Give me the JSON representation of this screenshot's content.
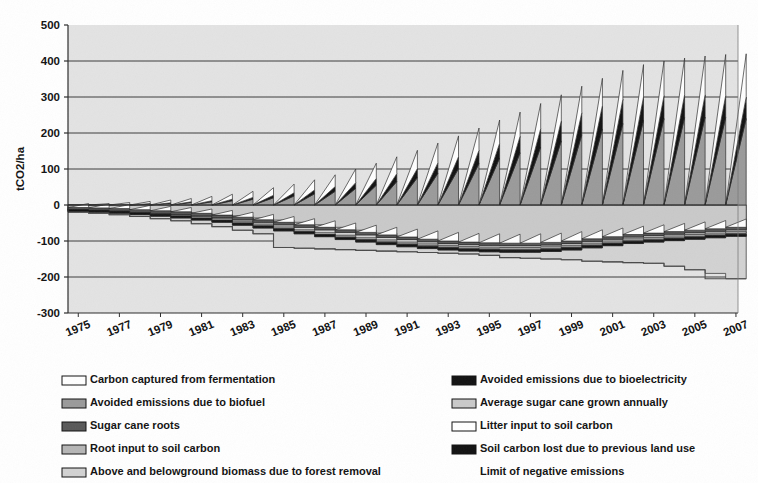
{
  "chart_data": {
    "type": "area",
    "title": "",
    "subtitle": "",
    "xlabel": "",
    "ylabel": "tCO2/ha",
    "ylim": [
      -300,
      500
    ],
    "xlim": [
      1975,
      2008
    ],
    "ytick_step": 100,
    "yticks": [
      "500",
      "400",
      "300",
      "200",
      "100",
      "0",
      "-100",
      "-200",
      "-300"
    ],
    "xticks": [
      "1975",
      "1977",
      "1979",
      "1981",
      "1983",
      "1985",
      "1987",
      "1989",
      "1991",
      "1993",
      "1995",
      "1997",
      "1999",
      "2001",
      "2003",
      "2005",
      "2007"
    ],
    "x_all_years": [
      1975,
      1976,
      1977,
      1978,
      1979,
      1980,
      1981,
      1982,
      1983,
      1984,
      1985,
      1986,
      1987,
      1988,
      1989,
      1990,
      1991,
      1992,
      1993,
      1994,
      1995,
      1996,
      1997,
      1998,
      1999,
      2000,
      2001,
      2002,
      2003,
      2004,
      2005,
      2006,
      2007
    ],
    "grid": "horizontal",
    "plot_background": "#e3e3e3",
    "legend_position": "below-two-columns",
    "series": [
      {
        "name": "Carbon captured from fermentation",
        "color": "#ffffff",
        "sawtooth": true,
        "cumulative_top_at_peak": [
          -12,
          -14,
          -16,
          -18,
          -21,
          -24,
          -28,
          -32,
          -37,
          -44,
          -50,
          -58,
          -66,
          -76,
          -86,
          -97,
          -108,
          -120,
          -132,
          -145,
          -158,
          -172,
          -186,
          -200,
          -214,
          -228,
          -242,
          -255,
          -268,
          -280,
          -292,
          -303,
          -314
        ],
        "peak_values": [
          2,
          4,
          7,
          10,
          14,
          18,
          24,
          30,
          38,
          48,
          58,
          70,
          84,
          100,
          116,
          134,
          152,
          172,
          192,
          214,
          236,
          258,
          282,
          306,
          330,
          352,
          374,
          390,
          400,
          408,
          414,
          418,
          420
        ]
      },
      {
        "name": "Avoided emissions due to bioelectricity",
        "color": "#111111",
        "sawtooth": true,
        "peak_values": [
          0,
          1,
          2,
          4,
          6,
          9,
          12,
          16,
          21,
          27,
          34,
          42,
          51,
          62,
          74,
          87,
          101,
          117,
          134,
          152,
          171,
          191,
          212,
          234,
          256,
          276,
          294,
          300,
          304,
          306,
          306,
          304,
          300
        ]
      },
      {
        "name": "Avoided emissions due to biofuel",
        "color": "#9a9a9a",
        "sawtooth": true,
        "peak_values": [
          0,
          1,
          2,
          3,
          5,
          7,
          9,
          12,
          16,
          20,
          25,
          31,
          38,
          46,
          55,
          65,
          76,
          88,
          101,
          115,
          130,
          145,
          161,
          178,
          195,
          211,
          226,
          235,
          240,
          243,
          244,
          243,
          240
        ]
      },
      {
        "name": "Average sugar cane grown annually",
        "color": "#c9c9c9",
        "sawtooth": true,
        "peak_values": [
          -10,
          -10,
          -12,
          -14,
          -16,
          -18,
          -22,
          -26,
          -30,
          -36,
          -42,
          -48,
          -55,
          -62,
          -70,
          -78,
          -86,
          -94,
          -100,
          -105,
          -108,
          -110,
          -110,
          -108,
          -104,
          -98,
          -92,
          -86,
          -82,
          -78,
          -74,
          -70,
          -66
        ]
      },
      {
        "name": "Sugar cane roots",
        "color": "#585858",
        "sawtooth": false,
        "values": [
          -14,
          -15,
          -17,
          -20,
          -23,
          -26,
          -30,
          -35,
          -41,
          -48,
          -55,
          -62,
          -69,
          -76,
          -83,
          -90,
          -96,
          -102,
          -107,
          -110,
          -112,
          -113,
          -113,
          -111,
          -107,
          -101,
          -95,
          -89,
          -85,
          -81,
          -77,
          -73,
          -69
        ]
      },
      {
        "name": "Litter input to soil carbon",
        "color": "#ffffff",
        "sawtooth": true,
        "peak_values": [
          -12,
          -13,
          -15,
          -17,
          -20,
          -23,
          -27,
          -31,
          -36,
          -42,
          -48,
          -54,
          -60,
          -66,
          -72,
          -78,
          -83,
          -88,
          -92,
          -95,
          -96,
          -97,
          -96,
          -94,
          -90,
          -85,
          -80,
          -75,
          -71,
          -67,
          -63,
          -59,
          -55
        ]
      },
      {
        "name": "Root input to soil carbon",
        "color": "#b5b5b5",
        "sawtooth": false,
        "values": [
          -16,
          -18,
          -21,
          -24,
          -28,
          -32,
          -37,
          -43,
          -50,
          -58,
          -66,
          -74,
          -82,
          -89,
          -96,
          -102,
          -108,
          -113,
          -117,
          -120,
          -122,
          -123,
          -123,
          -121,
          -117,
          -111,
          -105,
          -99,
          -95,
          -91,
          -87,
          -83,
          -79
        ]
      },
      {
        "name": "Soil carbon lost due to previous land use",
        "color": "#111111",
        "sawtooth": false,
        "values": [
          -18,
          -20,
          -23,
          -27,
          -31,
          -36,
          -42,
          -48,
          -56,
          -64,
          -72,
          -80,
          -88,
          -96,
          -103,
          -110,
          -116,
          -121,
          -125,
          -128,
          -130,
          -131,
          -131,
          -129,
          -125,
          -119,
          -113,
          -107,
          -103,
          -99,
          -95,
          -91,
          -87
        ]
      },
      {
        "name": "Above and belowground biomass due to forest removal",
        "color": "#d2d2d2",
        "sawtooth": false,
        "values": [
          -20,
          -23,
          -27,
          -32,
          -38,
          -44,
          -52,
          -60,
          -70,
          -80,
          -118,
          -120,
          -122,
          -124,
          -126,
          -128,
          -130,
          -132,
          -134,
          -136,
          -140,
          -146,
          -148,
          -150,
          -152,
          -156,
          -158,
          -160,
          -162,
          -170,
          -180,
          -190,
          -205
        ]
      },
      {
        "name": "Limit of negative emissions",
        "color": "#555555",
        "sawtooth": false,
        "is_line_only": true,
        "values": [
          -20,
          -23,
          -27,
          -32,
          -38,
          -44,
          -52,
          -60,
          -70,
          -80,
          -118,
          -120,
          -122,
          -124,
          -126,
          -128,
          -130,
          -132,
          -134,
          -136,
          -140,
          -146,
          -148,
          -150,
          -152,
          -156,
          -158,
          -160,
          -162,
          -170,
          -180,
          -205,
          -205
        ]
      }
    ]
  },
  "legend": {
    "columns": [
      {
        "items": [
          {
            "label": "Carbon captured from fermentation",
            "swatch": "#ffffff"
          },
          {
            "label": "Avoided emissions due to biofuel",
            "swatch": "#9a9a9a"
          },
          {
            "label": "Sugar cane roots",
            "swatch": "#585858"
          },
          {
            "label": "Root input to soil carbon",
            "swatch": "#b5b5b5"
          },
          {
            "label": "Above and belowground biomass due to forest removal",
            "swatch": "#d2d2d2"
          }
        ]
      },
      {
        "items": [
          {
            "label": "Avoided emissions due to bioelectricity",
            "swatch": "#111111"
          },
          {
            "label": "Average sugar cane grown annually",
            "swatch": "#c9c9c9"
          },
          {
            "label": "Litter input to soil carbon",
            "swatch": "#ffffff"
          },
          {
            "label": "Soil carbon lost due to previous land use",
            "swatch": "#111111"
          },
          {
            "label": "Limit of negative emissions",
            "swatch": null
          }
        ]
      }
    ]
  }
}
